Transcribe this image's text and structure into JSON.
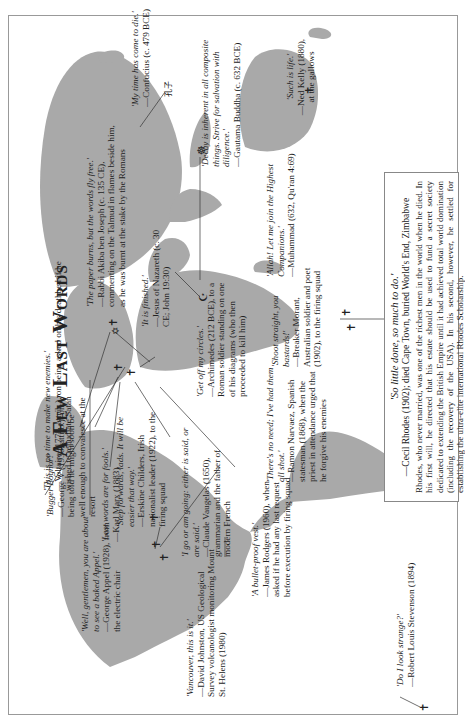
{
  "title": "A Few Last Words",
  "quotes": [
    {
      "id": "voltaire",
      "quote": "'This is no time to make new enemies.'",
      "attr": "—Voltaire (1778, attrib.), on being asked on his deathbed if he wished to repudiate Satan"
    },
    {
      "id": "marx",
      "quote": "'Last words are for fools.'",
      "attr": "—Karl Marx (1883)"
    },
    {
      "id": "akiba",
      "quote": "'The paper burns, but the words fly free.'",
      "attr": "—Rabbi Akiba ben Joseph (c. 135 CE), commenting on the Talmud in flames beside him, as he was burnt at the stake by the Romans"
    },
    {
      "id": "jesus",
      "quote": "'It is finished.'",
      "attr": "—Jesus of Nazareth (c. 30 CE; John 19:30)"
    },
    {
      "id": "confucius",
      "quote": "'My time has come to die.'",
      "attr": "—Confucius (c. 479 BCE)"
    },
    {
      "id": "buddha",
      "quote": "'Decay is inherent in all composite things. Strive for salvation with diligence.'",
      "attr": "—Gautama Buddha (c. 632 BCE)"
    },
    {
      "id": "kelly",
      "quote": "'Such is life.'",
      "attr": "—Ned Kelly (1880), at the gallows"
    },
    {
      "id": "muhammad",
      "quote": "'Allah! Let me join the Highest Companions.'",
      "attr": "—Muhammad (632, Qu'ran 4:69)"
    },
    {
      "id": "george5",
      "quote": "'Bugger Bognor!'",
      "attr": "—George V (1936, attrib.), on being told he might soon be well enough to convalesce at the resort"
    },
    {
      "id": "childers",
      "quote": "'Step forwards, lads. It will be easier that way.'",
      "attr": "—Erskine Childers, Irish nationalist leader (1922), to the firing squad"
    },
    {
      "id": "archimedes",
      "quote": "'Get off my circles.'",
      "attr": "—Archimedes (212 BCE), to a Roman soldier standing on one of his diagrams (who then proceeded to kill him)"
    },
    {
      "id": "morant",
      "quote": "'Shoot straight, you bastards!'",
      "attr": "—Breaker Morant, Australian soldier and poet (1902), to the firing squad"
    },
    {
      "id": "vaugelas",
      "quote": "'I go or am going: either is said, or are said.'",
      "attr": "—Claude Vaugelas (1650), grammarian and the father of modern French"
    },
    {
      "id": "narvaez",
      "quote": "'There's no need; I've had them all shot.'",
      "attr": "—Ramon Narvaez, Spanish statesman (1868), when the priest in attendance urged that he forgive his enemies"
    },
    {
      "id": "appel",
      "quote": "'Well, gentlemen, you are about to see a baked Appel.'",
      "attr": "—George Appel (1928), from the electric chair"
    },
    {
      "id": "rodgers",
      "quote": "'A bullet-proof vest.'",
      "attr": "—James Rodgers (1960), when asked if he had any last request before execution by firing squad"
    },
    {
      "id": "johnston",
      "quote": "'Vancouver, this is it.'",
      "attr": "—David Johnston, US Geological Survey volcanologist monitoring Mount St. Helens (1980)"
    },
    {
      "id": "stevenson",
      "quote": "'Do I look strange?'",
      "attr": "—Robert Louis Stevenson (1894)"
    }
  ],
  "rhodes_box": {
    "quote": "'So little done, so much to do.'",
    "attr": "—Cecil Rhodes (1902); died Cape Town, buried World's End, Zimbabwe",
    "body": "Rhodes, who never married, was one of the richest men in the world when he died. In his first will, he directed that his estate should be used to fund a secret society dedicated to extending the British Empire until it had achieved total world domination (including the recovery of the USA). In his second, however, he settled for establishing the ultra-elite international Rhodes Scholarship."
  },
  "symbols": {
    "cross": "✝",
    "star_of_david": "✡",
    "crescent": "☪",
    "dharma_wheel": "☸",
    "confucius_glyph": "孔子"
  },
  "colors": {
    "land": "#a9a9a9",
    "ink": "#222222",
    "frame": "#999999"
  }
}
